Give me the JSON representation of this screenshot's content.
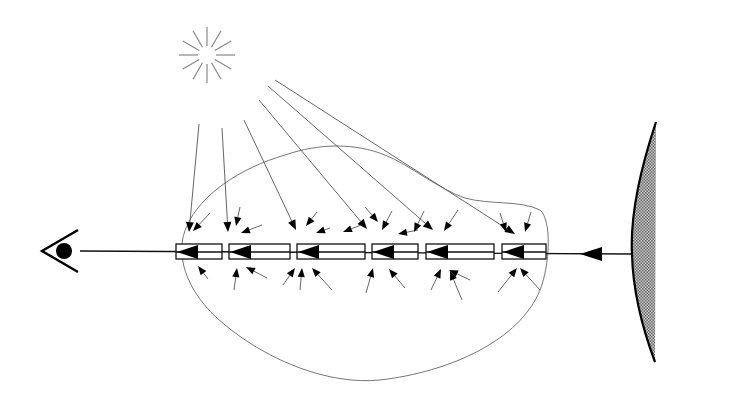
{
  "diagram": {
    "type": "radiative-transfer-illustration",
    "colors": {
      "background": "#ffffff",
      "ink": "#000000",
      "thin_line": "#555555",
      "sun_ray": "#888888",
      "surface_fill": "#9a9a9a"
    },
    "elements": {
      "sun": {
        "icon": "sun-icon",
        "center": [
          207,
          55
        ],
        "ray_count": 12,
        "inner_radius": 9,
        "outer_radius": 28
      },
      "eye": {
        "icon": "eye-icon",
        "vertex": [
          42,
          251
        ],
        "pupil_center": [
          64,
          251
        ],
        "pupil_radius": 8
      },
      "emitting_surface": {
        "icon": "curved-surface-icon",
        "top": [
          656,
          122
        ],
        "bottom": [
          655,
          362
        ],
        "bulge_x": 632
      },
      "line_of_sight": {
        "from": [
          632,
          254
        ],
        "to": [
          80,
          251
        ],
        "source_arrow_at": [
          596,
          254
        ]
      },
      "medium_outline": {
        "icon": "cloud-boundary"
      },
      "volume_elements": [
        {
          "x": 176,
          "w": 46
        },
        {
          "x": 229,
          "w": 61
        },
        {
          "x": 297,
          "w": 68
        },
        {
          "x": 372,
          "w": 46
        },
        {
          "x": 426,
          "w": 68
        },
        {
          "x": 502,
          "w": 44
        }
      ],
      "box_y": 244,
      "box_h": 15
    },
    "sun_rays_to_elements": [
      {
        "from": [
          199,
          124
        ],
        "to": [
          189,
          232
        ]
      },
      {
        "from": [
          222,
          128
        ],
        "to": [
          228,
          232
        ]
      },
      {
        "from": [
          244,
          120
        ],
        "to": [
          296,
          230
        ]
      },
      {
        "from": [
          259,
          100
        ],
        "to": [
          367,
          229
        ]
      },
      {
        "from": [
          268,
          86
        ],
        "to": [
          433,
          230
        ]
      },
      {
        "from": [
          275,
          80
        ],
        "to": [
          515,
          234
        ]
      }
    ],
    "scatter_arrows_above": [
      [
        210,
        213,
        193,
        231
      ],
      [
        240,
        207,
        236,
        226
      ],
      [
        262,
        225,
        241,
        233
      ],
      [
        317,
        212,
        306,
        226
      ],
      [
        330,
        228,
        316,
        233
      ],
      [
        361,
        225,
        343,
        232
      ],
      [
        365,
        207,
        378,
        222
      ],
      [
        392,
        211,
        382,
        230
      ],
      [
        418,
        230,
        398,
        234
      ],
      [
        424,
        211,
        414,
        232
      ],
      [
        458,
        210,
        444,
        231
      ],
      [
        500,
        213,
        506,
        232
      ],
      [
        531,
        212,
        525,
        232
      ]
    ],
    "scatter_arrows_below": [
      [
        208,
        279,
        198,
        266
      ],
      [
        234,
        290,
        237,
        268
      ],
      [
        267,
        278,
        246,
        267
      ],
      [
        283,
        285,
        295,
        268
      ],
      [
        300,
        290,
        302,
        268
      ],
      [
        332,
        290,
        312,
        268
      ],
      [
        366,
        293,
        373,
        268
      ],
      [
        405,
        288,
        389,
        269
      ],
      [
        431,
        290,
        441,
        269
      ],
      [
        462,
        300,
        450,
        271
      ],
      [
        470,
        280,
        449,
        270
      ],
      [
        498,
        292,
        517,
        268
      ],
      [
        540,
        290,
        520,
        268
      ]
    ]
  }
}
